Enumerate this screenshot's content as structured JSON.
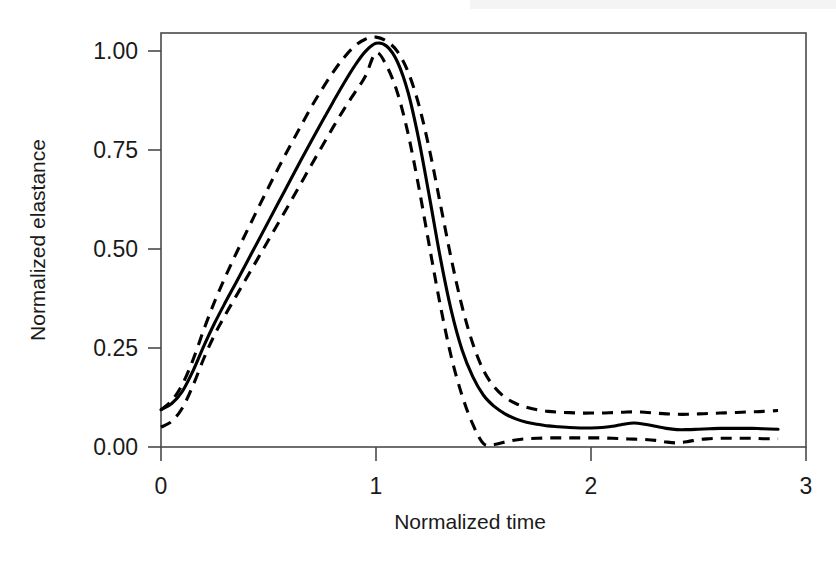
{
  "figure": {
    "background_color": "#ffffff",
    "line_color": "#000000",
    "axis_color": "#4a4a4a"
  },
  "axes": {
    "x_title": "Normalized time",
    "y_title": "Normalized elastance",
    "x_ticks": [
      "0",
      "1",
      "2",
      "3"
    ],
    "y_ticks": [
      "0.00",
      "0.25",
      "0.50",
      "0.75",
      "1.00"
    ]
  },
  "chart_data": {
    "type": "line",
    "title": "",
    "subtitle": "",
    "xlabel": "Normalized time",
    "ylabel": "Normalized elastance",
    "xlim": [
      0,
      3
    ],
    "ylim": [
      0.0,
      1.0
    ],
    "xticks": [
      0,
      1,
      2,
      3
    ],
    "yticks": [
      0.0,
      0.25,
      0.5,
      0.75,
      1.0
    ],
    "grid": false,
    "legend": null,
    "legend_position": "none",
    "annotations": [],
    "x": [
      0.0,
      0.05,
      0.1,
      0.15,
      0.2,
      0.25,
      0.3,
      0.35,
      0.4,
      0.45,
      0.5,
      0.55,
      0.6,
      0.65,
      0.7,
      0.75,
      0.8,
      0.85,
      0.9,
      0.95,
      1.0,
      1.05,
      1.1,
      1.15,
      1.2,
      1.25,
      1.3,
      1.35,
      1.4,
      1.45,
      1.5,
      1.55,
      1.6,
      1.65,
      1.7,
      1.75,
      1.8,
      1.85,
      1.9,
      1.95,
      2.0,
      2.05,
      2.1,
      2.15,
      2.2,
      2.25,
      2.3,
      2.35,
      2.4,
      2.45,
      2.5,
      2.55,
      2.6,
      2.65,
      2.7,
      2.75,
      2.8,
      2.87
    ],
    "series": [
      {
        "name": "mean",
        "style": "solid",
        "values": [
          0.09,
          0.105,
          0.135,
          0.185,
          0.245,
          0.3,
          0.35,
          0.398,
          0.447,
          0.496,
          0.545,
          0.594,
          0.643,
          0.692,
          0.74,
          0.787,
          0.833,
          0.878,
          0.92,
          0.955,
          0.975,
          0.968,
          0.93,
          0.855,
          0.74,
          0.6,
          0.455,
          0.33,
          0.235,
          0.17,
          0.125,
          0.098,
          0.08,
          0.068,
          0.06,
          0.055,
          0.051,
          0.049,
          0.047,
          0.046,
          0.046,
          0.047,
          0.05,
          0.055,
          0.058,
          0.055,
          0.05,
          0.045,
          0.042,
          0.042,
          0.043,
          0.044,
          0.045,
          0.045,
          0.045,
          0.045,
          0.044,
          0.043
        ]
      },
      {
        "name": "upper-bound",
        "style": "dashed",
        "values": [
          0.09,
          0.112,
          0.152,
          0.212,
          0.285,
          0.352,
          0.412,
          0.468,
          0.522,
          0.575,
          0.627,
          0.678,
          0.727,
          0.775,
          0.822,
          0.865,
          0.905,
          0.94,
          0.968,
          0.985,
          0.99,
          0.98,
          0.955,
          0.905,
          0.825,
          0.715,
          0.585,
          0.455,
          0.34,
          0.25,
          0.185,
          0.145,
          0.12,
          0.105,
          0.096,
          0.09,
          0.086,
          0.084,
          0.083,
          0.082,
          0.082,
          0.082,
          0.083,
          0.084,
          0.085,
          0.084,
          0.082,
          0.08,
          0.079,
          0.079,
          0.08,
          0.081,
          0.082,
          0.083,
          0.084,
          0.085,
          0.086,
          0.088
        ]
      },
      {
        "name": "lower-bound",
        "style": "dashed",
        "values": [
          0.048,
          0.062,
          0.095,
          0.15,
          0.215,
          0.272,
          0.32,
          0.365,
          0.41,
          0.455,
          0.5,
          0.545,
          0.59,
          0.636,
          0.682,
          0.727,
          0.772,
          0.815,
          0.855,
          0.895,
          0.952,
          0.92,
          0.855,
          0.755,
          0.625,
          0.48,
          0.34,
          0.218,
          0.125,
          0.055,
          0.008,
          0.006,
          0.012,
          0.017,
          0.02,
          0.021,
          0.022,
          0.022,
          0.022,
          0.022,
          0.022,
          0.022,
          0.021,
          0.02,
          0.019,
          0.018,
          0.016,
          0.012,
          0.01,
          0.013,
          0.018,
          0.02,
          0.021,
          0.021,
          0.021,
          0.021,
          0.02,
          0.02
        ]
      }
    ]
  }
}
